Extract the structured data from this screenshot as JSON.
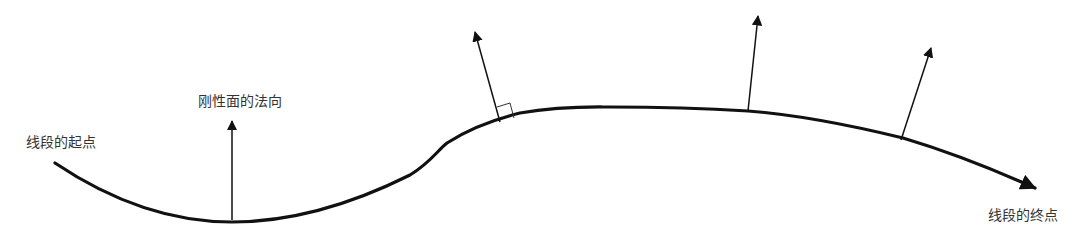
{
  "diagram": {
    "labels": {
      "start": "线段的起点",
      "normal": "刚性面的法向",
      "end": "线段的终点"
    },
    "colors": {
      "stroke": "#111111",
      "text": "#333333",
      "background": "#ffffff"
    },
    "elements": {
      "curve": "segment-curve",
      "normals_count": 4,
      "right_angle_marker": true
    }
  }
}
